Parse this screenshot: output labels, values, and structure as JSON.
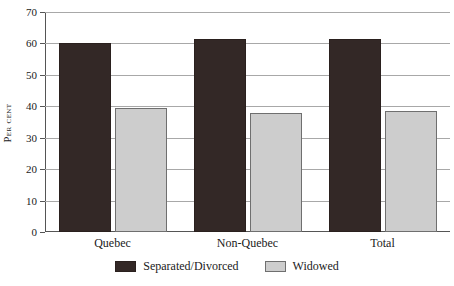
{
  "chart_data": {
    "type": "bar",
    "title": "",
    "xlabel": "",
    "ylabel": "Per cent",
    "ylim": [
      0,
      70
    ],
    "yticks": [
      0,
      10,
      20,
      30,
      40,
      50,
      60,
      70
    ],
    "grid": true,
    "legend_position": "bottom",
    "categories": [
      "Quebec",
      "Non-Quebec",
      "Total"
    ],
    "series": [
      {
        "name": "Separated/Divorced",
        "color": "#332826",
        "values": [
          60.0,
          61.5,
          61.3
        ]
      },
      {
        "name": "Widowed",
        "color": "#cdcdcd",
        "values": [
          39.5,
          38.0,
          38.5
        ]
      }
    ]
  },
  "axis": {
    "y_title": "Per cent",
    "tick_labels": [
      "0",
      "10",
      "20",
      "30",
      "40",
      "50",
      "60",
      "70"
    ]
  },
  "categories": {
    "0": "Quebec",
    "1": "Non-Quebec",
    "2": "Total"
  },
  "legend": {
    "items": [
      {
        "label": "Separated/Divorced",
        "color": "#332826"
      },
      {
        "label": "Widowed",
        "color": "#cdcdcd"
      }
    ]
  }
}
